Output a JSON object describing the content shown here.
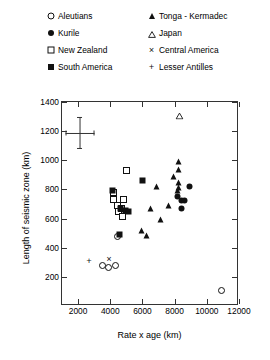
{
  "chart_data": {
    "type": "scatter",
    "title": "",
    "xlabel": "Rate x age (km)",
    "ylabel": "Length of seismic zone (km)",
    "xlim": [
      1000,
      12000
    ],
    "ylim": [
      0,
      1400
    ],
    "xticks": [
      2000,
      4000,
      6000,
      8000,
      10000,
      12000
    ],
    "yticks": [
      200,
      400,
      600,
      800,
      1000,
      1200,
      1400
    ],
    "grid": false,
    "legend_position": "above-plot",
    "error_bar": {
      "x": 2100,
      "y": 1190,
      "x_err": 900,
      "y_err": 110
    },
    "series": [
      {
        "name": "Aleutians",
        "marker": "open-circle",
        "points": [
          [
            3800,
            250
          ],
          [
            4200,
            232
          ],
          [
            4600,
            250
          ],
          [
            4700,
            445
          ],
          [
            11200,
            75
          ]
        ]
      },
      {
        "name": "Kurile",
        "marker": "filled-circle",
        "points": [
          [
            8450,
            720
          ],
          [
            8700,
            690
          ],
          [
            8900,
            690
          ],
          [
            8700,
            640
          ],
          [
            9200,
            790
          ]
        ]
      },
      {
        "name": "New Zealand",
        "marker": "open-square",
        "points": [
          [
            4450,
            745
          ],
          [
            4500,
            700
          ],
          [
            4700,
            660
          ],
          [
            4800,
            615
          ],
          [
            5000,
            640
          ],
          [
            5050,
            580
          ],
          [
            5300,
            900
          ],
          [
            5100,
            700
          ]
        ]
      },
      {
        "name": "South America",
        "marker": "filled-square",
        "points": [
          [
            4400,
            760
          ],
          [
            4900,
            635
          ],
          [
            5250,
            625
          ],
          [
            5400,
            620
          ],
          [
            4850,
            460
          ],
          [
            6300,
            830
          ]
        ]
      },
      {
        "name": "Tonga - Kermadec",
        "marker": "filled-triangle",
        "points": [
          [
            7150,
            790
          ],
          [
            7900,
            660
          ],
          [
            8200,
            860
          ],
          [
            8500,
            960
          ],
          [
            8550,
            905
          ],
          [
            8500,
            820
          ],
          [
            8550,
            780
          ],
          [
            8450,
            760
          ],
          [
            7400,
            560
          ],
          [
            6800,
            640
          ],
          [
            6250,
            490
          ],
          [
            6500,
            455
          ]
        ]
      },
      {
        "name": "Japan",
        "marker": "open-triangle",
        "points": [
          [
            8600,
            1280
          ]
        ]
      },
      {
        "name": "Central America",
        "marker": "x",
        "points": [
          [
            4200,
            285
          ]
        ]
      },
      {
        "name": "Lesser Antilles",
        "marker": "plus",
        "points": [
          [
            2950,
            272
          ]
        ]
      }
    ]
  },
  "legend": {
    "items": [
      {
        "label": "Aleutians",
        "marker": "open-circle",
        "col": 0,
        "row": 0
      },
      {
        "label": "Kurile",
        "marker": "filled-circle",
        "col": 0,
        "row": 1
      },
      {
        "label": "New Zealand",
        "marker": "open-square",
        "col": 0,
        "row": 2
      },
      {
        "label": "South America",
        "marker": "filled-square",
        "col": 0,
        "row": 3
      },
      {
        "label": "Tonga - Kermadec",
        "marker": "filled-triangle",
        "col": 1,
        "row": 0
      },
      {
        "label": "Japan",
        "marker": "open-triangle",
        "col": 1,
        "row": 1
      },
      {
        "label": "Central America",
        "marker": "x",
        "col": 1,
        "row": 2
      },
      {
        "label": "Lesser Antilles",
        "marker": "plus",
        "col": 1,
        "row": 3
      }
    ]
  },
  "colors": {
    "axis": "#333333",
    "marker": "#111111",
    "background": "#ffffff"
  }
}
